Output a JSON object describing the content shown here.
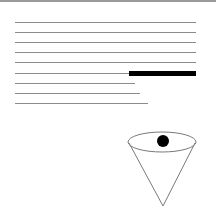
{
  "diagram": {
    "colors": {
      "line": "#8c8c8c",
      "border": "#9a9a9a",
      "redaction": "#000000",
      "cone_stroke": "#7a7a7a",
      "dot": "#000000"
    },
    "lines": [
      {
        "x1": 15,
        "x2": 196,
        "y": 22
      },
      {
        "x1": 15,
        "x2": 196,
        "y": 32
      },
      {
        "x1": 15,
        "x2": 196,
        "y": 42
      },
      {
        "x1": 15,
        "x2": 196,
        "y": 52
      },
      {
        "x1": 15,
        "x2": 196,
        "y": 62
      },
      {
        "x1": 15,
        "x2": 129,
        "y": 73
      },
      {
        "x1": 15,
        "x2": 135,
        "y": 83
      },
      {
        "x1": 15,
        "x2": 140,
        "y": 93
      },
      {
        "x1": 15,
        "x2": 148,
        "y": 103
      }
    ],
    "redaction_bar": {
      "x": 129,
      "y": 71,
      "width": 67,
      "height": 5
    },
    "cone": {
      "cx": 162,
      "cy": 142,
      "rx": 34,
      "ry": 10,
      "apex_x": 163,
      "apex_y": 206
    },
    "dot": {
      "cx": 163,
      "cy": 141,
      "r": 6
    }
  }
}
